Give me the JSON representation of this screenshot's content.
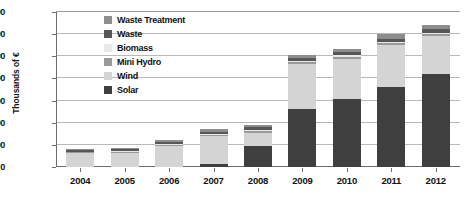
{
  "chart_data": {
    "type": "bar",
    "stacked": true,
    "title": "",
    "xlabel": "",
    "ylabel": "Thousands of €",
    "categories": [
      "2004",
      "2005",
      "2006",
      "2007",
      "2008",
      "2009",
      "2010",
      "2011",
      "2012"
    ],
    "ylim": [
      0,
      7000000
    ],
    "ytick_values": [
      0,
      1000000,
      2000000,
      3000000,
      4000000,
      5000000,
      6000000,
      7000000
    ],
    "ytick_labels": [
      "0",
      "1000000",
      "2000000",
      "3000000",
      "4000000",
      "5000000",
      "6000000",
      "7000000"
    ],
    "grid": "horizontal",
    "legend_position": "inside-upper-left",
    "series": [
      {
        "name": "Solar",
        "color": "#3f3f3f",
        "values": [
          0,
          0,
          0,
          150000,
          950000,
          2600000,
          3050000,
          3600000,
          4200000
        ]
      },
      {
        "name": "Wind",
        "color": "#d4d4d4",
        "values": [
          620000,
          650000,
          950000,
          1250000,
          600000,
          2050000,
          1850000,
          1900000,
          1700000
        ]
      },
      {
        "name": "Mini Hydro",
        "color": "#9a9a9a",
        "values": [
          40000,
          45000,
          55000,
          60000,
          70000,
          80000,
          85000,
          90000,
          95000
        ]
      },
      {
        "name": "Biomass",
        "color": "#e8e8e8",
        "values": [
          30000,
          35000,
          40000,
          45000,
          50000,
          55000,
          60000,
          65000,
          70000
        ]
      },
      {
        "name": "Waste",
        "color": "#575757",
        "values": [
          60000,
          65000,
          80000,
          100000,
          120000,
          130000,
          140000,
          150000,
          160000
        ]
      },
      {
        "name": "Waste Treatment",
        "color": "#8d8d8d",
        "values": [
          50000,
          55000,
          75000,
          95000,
          110000,
          125000,
          150000,
          195000,
          175000
        ]
      }
    ],
    "totals": [
      800000,
      850000,
      1200000,
      1700000,
      1900000,
      5040000,
      5335000,
      6000000,
      6400000
    ],
    "legend_entries": [
      {
        "label": "Waste Treatment",
        "color": "#8d8d8d"
      },
      {
        "label": "Waste",
        "color": "#575757"
      },
      {
        "label": "Biomass",
        "color": "#e8e8e8"
      },
      {
        "label": "Mini Hydro",
        "color": "#9a9a9a"
      },
      {
        "label": "Wind",
        "color": "#d4d4d4"
      },
      {
        "label": "Solar",
        "color": "#3f3f3f"
      }
    ]
  },
  "axis_colors": {
    "gridline": "#b9b9b9",
    "axis_line": "#6d6d6d",
    "text": "#111111"
  }
}
